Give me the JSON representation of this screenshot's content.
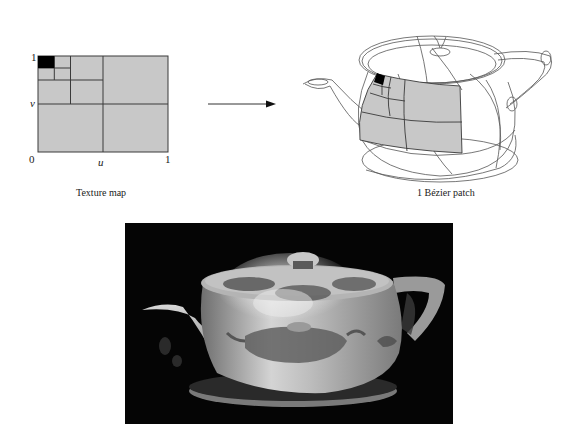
{
  "texture_map": {
    "caption": "Texture map",
    "axis_labels": {
      "origin": "0",
      "u_label": "u",
      "u_max": "1",
      "v_label": "v",
      "v_max": "1"
    },
    "fill_color": "#c8c8c8",
    "highlight_color": "#000000",
    "line_color": "#3a3a3a"
  },
  "arrow": {
    "direction": "right",
    "color": "#222222"
  },
  "bezier_patch": {
    "caption": "1 Bézier patch",
    "wireframe_color": "#555555",
    "patch_fill": "#c8c8c8"
  },
  "rendered_teapot": {
    "background": "#050505",
    "description": "Rendered Utah teapot with the teapot texture mapped onto its surface"
  }
}
